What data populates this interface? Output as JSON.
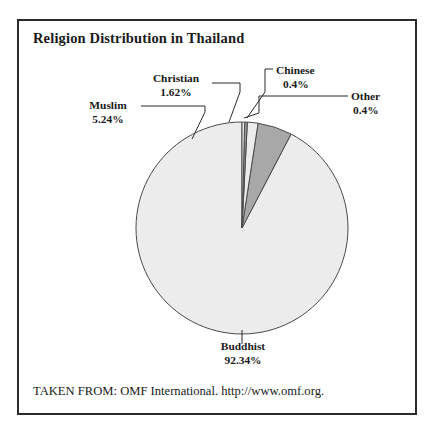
{
  "chart_data": {
    "type": "pie",
    "title": "Religion Distribution in Thailand",
    "xlabel": "",
    "ylabel": "",
    "grid": false,
    "legend_position": "callout-labels",
    "start_angle_deg": 90,
    "direction": "counterclockwise",
    "categories": [
      "Buddhist",
      "Muslim",
      "Christian",
      "Chinese",
      "Other"
    ],
    "values": [
      92.34,
      5.24,
      1.62,
      0.4,
      0.4
    ],
    "value_labels": [
      "92.34%",
      "5.24%",
      "1.62%",
      "0.4%",
      "0.4%"
    ],
    "slices": [
      {
        "label": "Buddhist",
        "value": 92.34,
        "value_label": "92.34%",
        "color": "#ececec"
      },
      {
        "label": "Muslim",
        "value": 5.24,
        "value_label": "5.24%",
        "color": "#a8a8a8"
      },
      {
        "label": "Christian",
        "value": 1.62,
        "value_label": "1.62%",
        "color": "#ececec"
      },
      {
        "label": "Chinese",
        "value": 0.4,
        "value_label": "0.4%",
        "color": "#9a9a9a"
      },
      {
        "label": "Other",
        "value": 0.4,
        "value_label": "0.4%",
        "color": "#ececec"
      }
    ]
  },
  "figure": {
    "title": "Religion Distribution in Thailand",
    "source_note": "TAKEN FROM: OMF International. http://www.omf.org.",
    "border_color": "#2b2b2b",
    "slice_outline_color": "#4a4a4a"
  },
  "labels": {
    "christian": {
      "name": "Christian",
      "pct": "1.62%"
    },
    "muslim": {
      "name": "Muslim",
      "pct": "5.24%"
    },
    "chinese": {
      "name": "Chinese",
      "pct": "0.4%"
    },
    "other": {
      "name": "Other",
      "pct": "0.4%"
    },
    "buddhist": {
      "name": "Buddhist",
      "pct": "92.34%"
    }
  }
}
